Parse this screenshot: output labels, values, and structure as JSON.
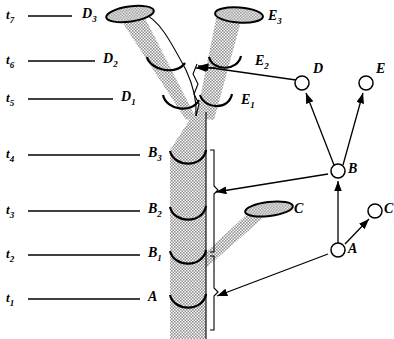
{
  "figure": {
    "type": "branching-shoot-and-graph-diagram",
    "colors": {
      "ink": "#000000",
      "stem_fill": "#9a9a9a",
      "background": "#ffffff"
    }
  },
  "time_axis": {
    "name": "time-axis",
    "rows": [
      {
        "id": "t7",
        "time_label": "t",
        "time_sub": "7",
        "segment_label": "D",
        "segment_sub": "3",
        "y": 16,
        "rule_x1": 28,
        "rule_x2": 72
      },
      {
        "id": "t6",
        "time_label": "t",
        "time_sub": "6",
        "segment_label": "D",
        "segment_sub": "2",
        "y": 61,
        "rule_x1": 28,
        "rule_x2": 95
      },
      {
        "id": "t5",
        "time_label": "t",
        "time_sub": "5",
        "segment_label": "D",
        "segment_sub": "1",
        "y": 99,
        "rule_x1": 28,
        "rule_x2": 113
      },
      {
        "id": "t4",
        "time_label": "t",
        "time_sub": "4",
        "segment_label": "B",
        "segment_sub": "3",
        "y": 155,
        "rule_x1": 28,
        "rule_x2": 140
      },
      {
        "id": "t3",
        "time_label": "t",
        "time_sub": "3",
        "segment_label": "B",
        "segment_sub": "2",
        "y": 211,
        "rule_x1": 28,
        "rule_x2": 140
      },
      {
        "id": "t2",
        "time_label": "t",
        "time_sub": "2",
        "segment_label": "B",
        "segment_sub": "1",
        "y": 255,
        "rule_x1": 28,
        "rule_x2": 140
      },
      {
        "id": "t1",
        "time_label": "t",
        "time_sub": "1",
        "segment_label": "A",
        "segment_sub": "",
        "y": 299,
        "rule_x1": 28,
        "rule_x2": 140
      }
    ]
  },
  "stem_labels": [
    {
      "id": "E3",
      "letter": "E",
      "sub": "3",
      "x": 268,
      "y": 17
    },
    {
      "id": "E2",
      "letter": "E",
      "sub": "2",
      "x": 255,
      "y": 62
    },
    {
      "id": "E1",
      "letter": "E",
      "sub": "1",
      "x": 241,
      "y": 101
    },
    {
      "id": "C",
      "letter": "C",
      "sub": "",
      "x": 296,
      "y": 212
    }
  ],
  "graph": {
    "name": "node-graph",
    "nodes": [
      {
        "id": "D",
        "label": "D",
        "cx": 302,
        "cy": 83,
        "r": 7,
        "label_x": 313,
        "label_y": 70
      },
      {
        "id": "E",
        "label": "E",
        "cx": 366,
        "cy": 83,
        "r": 7,
        "label_x": 376,
        "label_y": 70
      },
      {
        "id": "B",
        "label": "B",
        "cx": 338,
        "cy": 171,
        "r": 7,
        "label_x": 349,
        "label_y": 165
      },
      {
        "id": "C",
        "label": "C",
        "cx": 375,
        "cy": 211,
        "r": 7,
        "label_x": 386,
        "label_y": 205
      },
      {
        "id": "A",
        "label": "A",
        "cx": 338,
        "cy": 250,
        "r": 7,
        "label_x": 349,
        "label_y": 245
      }
    ],
    "edges": [
      {
        "from": "B",
        "to": "D",
        "type": "arrow"
      },
      {
        "from": "B",
        "to": "E",
        "type": "arrow"
      },
      {
        "from": "A",
        "to": "B",
        "type": "arrow"
      },
      {
        "from": "A",
        "to": "C",
        "type": "arrow"
      }
    ]
  },
  "correspondence_arrows": [
    {
      "id": "arrow-to-E-shoot",
      "desc": "from node D leftwards to E shoot segment",
      "x1": 296,
      "y1": 80,
      "x2": 196,
      "y2": 66
    },
    {
      "id": "arrow-to-B-shoot",
      "desc": "from node B leftwards to B stem brace",
      "x1": 328,
      "y1": 174,
      "x2": 214,
      "y2": 192
    },
    {
      "id": "arrow-to-A-shoot",
      "desc": "from node A leftwards to A stem brace",
      "x1": 328,
      "y1": 254,
      "x2": 215,
      "y2": 297
    },
    {
      "id": "arrow-fork-pointer",
      "desc": "short arrow pointing at the fork crotch",
      "x1": 215,
      "y1": 68,
      "x2": 193,
      "y2": 68
    }
  ]
}
